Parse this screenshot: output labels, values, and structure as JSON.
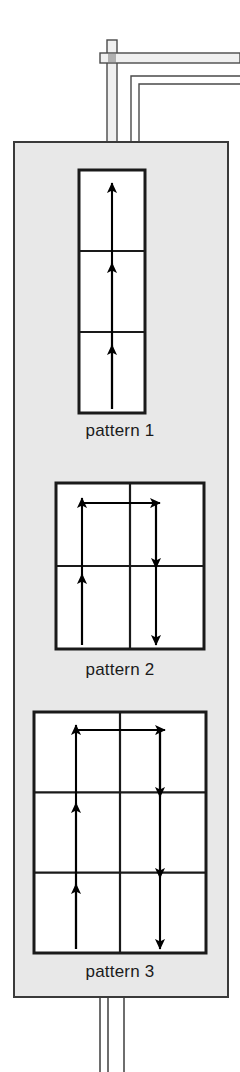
{
  "figure": {
    "background_color": "#ffffff",
    "panel": {
      "name": "pattern-panel",
      "fill_color": "#e8e8e8",
      "stroke_color": "#3a3a3a",
      "x": 14,
      "y": 142,
      "width": 214,
      "height": 855
    },
    "pipes": {
      "stroke_color": "#4a4a4a",
      "fill_color": "#f0f0f0",
      "junction_color": "#b0b0b0",
      "top_vertical_x": 112,
      "top_horizontal_y": 58,
      "inner_bend_x": 131,
      "inner_bend_y": 76,
      "bottom_lines_x": [
        100,
        108,
        124
      ],
      "bottom_extent_y": 1072
    }
  },
  "patterns": [
    {
      "id": "pattern-1",
      "label": "pattern 1",
      "cols": 1,
      "rows": 3,
      "box": {
        "x": 79,
        "y": 170,
        "width": 66,
        "height": 243
      },
      "cell_width": 66,
      "cell_height": 81,
      "arrows": [
        {
          "name": "arrow-up-col0-row2",
          "dir": "up",
          "x1": 112,
          "y1": 409,
          "x2": 112,
          "y2": 345
        },
        {
          "name": "arrow-up-col0-row1",
          "dir": "up",
          "x1": 112,
          "y1": 409,
          "x2": 112,
          "y2": 263
        },
        {
          "name": "arrow-up-col0-row0",
          "dir": "up",
          "x1": 112,
          "y1": 409,
          "x2": 112,
          "y2": 183
        }
      ]
    },
    {
      "id": "pattern-2",
      "label": "pattern 2",
      "cols": 2,
      "rows": 2,
      "box": {
        "x": 56,
        "y": 483,
        "width": 148,
        "height": 166
      },
      "cell_width": 74,
      "cell_height": 83,
      "arrows": [
        {
          "name": "arrow-up-col0-row1",
          "dir": "up",
          "x1": 82,
          "y1": 645,
          "x2": 82,
          "y2": 574
        },
        {
          "name": "arrow-up-col0-row0",
          "dir": "up",
          "x1": 82,
          "y1": 645,
          "x2": 82,
          "y2": 498
        },
        {
          "name": "arrow-right-row0",
          "dir": "right",
          "x1": 82,
          "y1": 503,
          "x2": 160,
          "y2": 503
        },
        {
          "name": "arrow-down-col1-row0",
          "dir": "down",
          "x1": 156,
          "y1": 503,
          "x2": 156,
          "y2": 568
        },
        {
          "name": "arrow-down-col1-row1",
          "dir": "down",
          "x1": 156,
          "y1": 503,
          "x2": 156,
          "y2": 645
        }
      ]
    },
    {
      "id": "pattern-3",
      "label": "pattern 3",
      "cols": 2,
      "rows": 3,
      "box": {
        "x": 34,
        "y": 712,
        "width": 172,
        "height": 241
      },
      "cell_width": 86,
      "cell_height": 80,
      "arrows": [
        {
          "name": "arrow-up-col0-row2",
          "dir": "up",
          "x1": 76,
          "y1": 949,
          "x2": 76,
          "y2": 884
        },
        {
          "name": "arrow-up-col0-row1",
          "dir": "up",
          "x1": 76,
          "y1": 949,
          "x2": 76,
          "y2": 803
        },
        {
          "name": "arrow-up-col0-row0",
          "dir": "up",
          "x1": 76,
          "y1": 949,
          "x2": 76,
          "y2": 725
        },
        {
          "name": "arrow-right-row0",
          "dir": "right",
          "x1": 76,
          "y1": 730,
          "x2": 165,
          "y2": 730
        },
        {
          "name": "arrow-down-col1-row0",
          "dir": "down",
          "x1": 160,
          "y1": 730,
          "x2": 160,
          "y2": 797
        },
        {
          "name": "arrow-down-col1-row1",
          "dir": "down",
          "x1": 160,
          "y1": 730,
          "x2": 160,
          "y2": 878
        },
        {
          "name": "arrow-down-col1-row2",
          "dir": "down",
          "x1": 160,
          "y1": 730,
          "x2": 160,
          "y2": 949
        }
      ]
    }
  ],
  "colors": {
    "arrow": "#000000",
    "grid_stroke": "#1a1a1a",
    "cell_fill": "#ffffff",
    "label_text": "#1b1b1b"
  }
}
